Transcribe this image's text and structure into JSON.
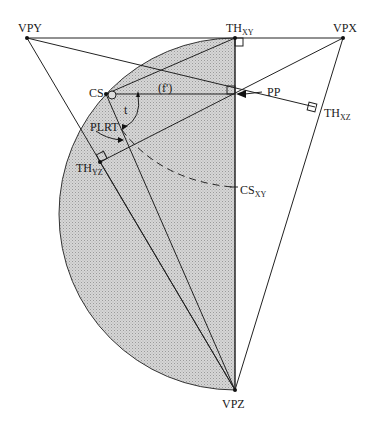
{
  "diagram": {
    "type": "perspective-geometry",
    "labels": {
      "vpy": "VPY",
      "vpx": "VPX",
      "vpz": "VPZ",
      "th_xy_main": "TH",
      "th_xy_sub": "XY",
      "th_xz_main": "TH",
      "th_xz_sub": "XZ",
      "th_yz_main": "TH",
      "th_yz_sub": "YZ",
      "cs": "CS",
      "pp": "PP",
      "f": "(f')",
      "t": "t",
      "plrt": "PLRT",
      "cs_xy_main": "CS",
      "cs_xy_sub": "XY"
    },
    "colors": {
      "shade": "#cfcfcf",
      "line": "#222222",
      "background": "#ffffff"
    }
  }
}
